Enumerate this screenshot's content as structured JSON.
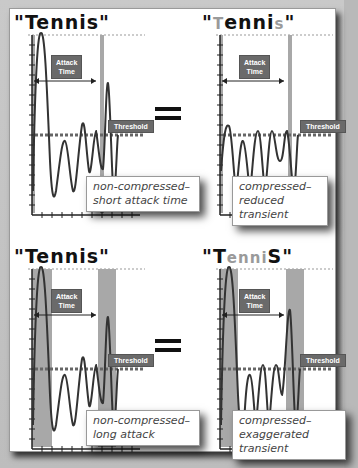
{
  "figure": {
    "equals_symbol": "=",
    "panels": [
      {
        "id": "top-left",
        "title_parts": [
          {
            "text": "\"Tennis\"",
            "style": "normal"
          }
        ],
        "attack_label": "Attack\nTime",
        "threshold_label": "Threshold",
        "caption_line1": "non-compressed–",
        "caption_line2": "short attack time",
        "attack_band": "short"
      },
      {
        "id": "top-right",
        "title_parts": [
          {
            "text": "\"",
            "style": "normal"
          },
          {
            "text": "T",
            "style": "dim"
          },
          {
            "text": "enni",
            "style": "normal"
          },
          {
            "text": "s",
            "style": "dim"
          },
          {
            "text": "\"",
            "style": "normal"
          }
        ],
        "attack_label": "Attack\nTime",
        "threshold_label": "Threshold",
        "caption_line1": "compressed–",
        "caption_line2": "reduced transient",
        "attack_band": "short"
      },
      {
        "id": "bottom-left",
        "title_parts": [
          {
            "text": "\"Tennis\"",
            "style": "normal"
          }
        ],
        "attack_label": "Attack\nTime",
        "threshold_label": "Threshold",
        "caption_line1": "non-compressed–",
        "caption_line2": "long attack",
        "attack_band": "long"
      },
      {
        "id": "bottom-right",
        "title_parts": [
          {
            "text": "\"T",
            "style": "normal"
          },
          {
            "text": "enni",
            "style": "dim"
          },
          {
            "text": "S\"",
            "style": "normal"
          }
        ],
        "attack_label": "Attack\nTime",
        "threshold_label": "Threshold",
        "caption_line1": "compressed–",
        "caption_line2": "exaggerated transient",
        "attack_band": "long"
      }
    ],
    "colors": {
      "background": "#b9b9b9",
      "panel": "#ffffff",
      "label_box": "#6a6a6a",
      "attack_band": "#a8a8a8",
      "waveform": "#333333"
    }
  },
  "labels": {
    "tl_title": "\"Tennis\"",
    "tr_q1": "\"",
    "tr_T": "T",
    "tr_enni": "enni",
    "tr_s": "s",
    "tr_q2": "\"",
    "bl_title": "\"Tennis\"",
    "br_qT": "\"T",
    "br_enni": "enni",
    "br_Sq": "S\"",
    "attack_l1": "Attack",
    "attack_l2": "Time",
    "threshold": "Threshold",
    "tl_cap1": "non-compressed–",
    "tl_cap2": "short attack time",
    "tr_cap1": "compressed–",
    "tr_cap2": "reduced transient",
    "bl_cap1": "non-compressed–",
    "bl_cap2": "long attack",
    "br_cap1": "compressed–",
    "br_cap2": "exaggerated transient"
  }
}
